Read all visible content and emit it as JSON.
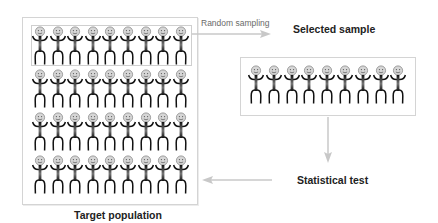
{
  "diagram": {
    "nodes": {
      "population": {
        "label": "Target population",
        "rows": 4,
        "columns": 9,
        "figure_icon": "stick-person-smiley-icon"
      },
      "sample": {
        "label": "Selected sample",
        "rows": 1,
        "columns": 9,
        "figure_icon": "stick-person-smiley-icon"
      },
      "test": {
        "label": "Statistical test"
      }
    },
    "edges": [
      {
        "from": "population (first row)",
        "to": "sample",
        "label": "Random sampling"
      },
      {
        "from": "sample",
        "to": "test",
        "label": ""
      },
      {
        "from": "test",
        "to": "population",
        "label": ""
      }
    ],
    "colors": {
      "box_border": "#d4d4d4",
      "arrow": "#c8c8c8",
      "figure_body": "#1a1a1a",
      "figure_head": "#a8a8a8",
      "text": "#222222",
      "edge_label": "#6a6a6a"
    }
  }
}
